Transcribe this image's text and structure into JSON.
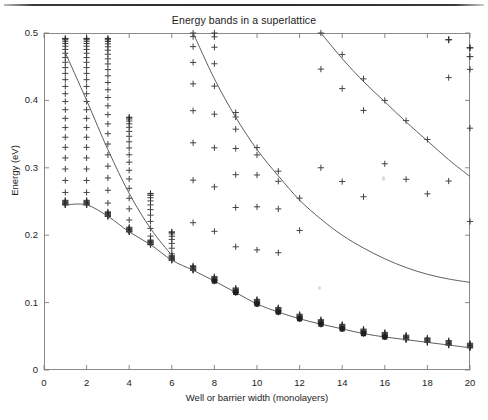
{
  "figure": {
    "title": "Energy bands in a superlattice",
    "page_rule": "horizontal-rule"
  },
  "chart_data": {
    "type": "scatter",
    "title": "Energy bands in a superlattice",
    "xlabel": "Well or barrier width (monolayers)",
    "ylabel": "Energy (eV)",
    "xlim": [
      0,
      20
    ],
    "ylim": [
      0,
      0.5
    ],
    "xticks": [
      0,
      2,
      4,
      6,
      8,
      10,
      12,
      14,
      16,
      18,
      20
    ],
    "xtick_labels": [
      "0",
      "2",
      "4",
      "6",
      "8",
      "10",
      "12",
      "14",
      "16",
      "18",
      "20"
    ],
    "yticks": [
      0,
      0.1,
      0.2,
      0.3,
      0.4,
      0.5
    ],
    "ytick_labels": [
      "0",
      "0.1",
      "0.2",
      "0.3",
      "0.4",
      "0.5"
    ],
    "grid": false,
    "legend": false,
    "marker": "plus",
    "marker_color": "#2b2b2b",
    "line_color": "#555555",
    "band_edges_note": "Vertical columns of + markers mark the allowed miniband extent at each integer monolayer width; solid curves trace the band-edge energies.",
    "series": [
      {
        "name": "band-1-edge",
        "x": [
          1,
          2,
          3,
          4,
          5,
          6,
          7,
          8,
          9,
          10,
          11,
          12,
          13,
          14,
          15,
          16,
          17,
          18,
          19,
          20
        ],
        "values": [
          0.245,
          0.245,
          0.228,
          0.205,
          0.186,
          0.163,
          0.148,
          0.132,
          0.115,
          0.098,
          0.086,
          0.076,
          0.068,
          0.061,
          0.054,
          0.049,
          0.045,
          0.041,
          0.037,
          0.033
        ]
      },
      {
        "name": "band-2-edge",
        "x": [
          7,
          8,
          9,
          10,
          11,
          12,
          13,
          14,
          15,
          16,
          17,
          18,
          19,
          20
        ],
        "values": [
          0.5,
          0.432,
          0.375,
          0.327,
          0.288,
          0.252,
          0.224,
          0.2,
          0.181,
          0.165,
          0.152,
          0.142,
          0.135,
          0.13
        ]
      },
      {
        "name": "band-3-edge",
        "x": [
          13,
          14,
          15,
          16,
          17,
          18,
          19,
          20
        ],
        "values": [
          0.5,
          0.462,
          0.428,
          0.398,
          0.368,
          0.34,
          0.312,
          0.287
        ]
      },
      {
        "name": "band-0-line",
        "x": [
          1,
          2,
          3,
          4,
          5,
          6
        ],
        "values": [
          0.471,
          0.4,
          0.327,
          0.262,
          0.21,
          0.17
        ]
      }
    ],
    "columns": [
      {
        "x": 1,
        "top": 0.492,
        "bottom": 0.245,
        "count": 26
      },
      {
        "x": 2,
        "top": 0.492,
        "bottom": 0.245,
        "count": 26
      },
      {
        "x": 3,
        "top": 0.492,
        "bottom": 0.228,
        "count": 26
      },
      {
        "x": 4,
        "top": 0.375,
        "bottom": 0.205,
        "count": 19
      },
      {
        "x": 5,
        "top": 0.262,
        "bottom": 0.186,
        "count": 12
      },
      {
        "x": 6,
        "top": 0.205,
        "bottom": 0.163,
        "count": 9
      },
      {
        "x": 7,
        "top": 0.5,
        "bottom": 0.148,
        "count": 10
      },
      {
        "x": 8,
        "top": 0.5,
        "bottom": 0.132,
        "count": 10
      },
      {
        "x": 9,
        "top": 0.382,
        "bottom": 0.115,
        "count": 8
      },
      {
        "x": 10,
        "top": 0.33,
        "bottom": 0.098,
        "count": 6
      },
      {
        "x": 11,
        "top": 0.295,
        "bottom": 0.086,
        "count": 5
      },
      {
        "x": 12,
        "top": 0.255,
        "bottom": 0.076,
        "count": 3
      },
      {
        "x": 13,
        "top": 0.5,
        "bottom": 0.068,
        "count": 4
      },
      {
        "x": 14,
        "top": 0.468,
        "bottom": 0.061,
        "count": 4
      },
      {
        "x": 15,
        "top": 0.432,
        "bottom": 0.054,
        "count": 4
      },
      {
        "x": 16,
        "top": 0.4,
        "bottom": 0.049,
        "count": 3
      },
      {
        "x": 17,
        "top": 0.37,
        "bottom": 0.045,
        "count": 3
      },
      {
        "x": 18,
        "top": 0.342,
        "bottom": 0.041,
        "count": 3
      },
      {
        "x": 19,
        "top": 0.49,
        "bottom": 0.037,
        "count": 4
      },
      {
        "x": 20,
        "top": 0.478,
        "bottom": 0.033,
        "count": 5
      }
    ],
    "extra_markers": [
      {
        "x": 19,
        "y": 0.49
      },
      {
        "x": 20,
        "y": 0.478
      },
      {
        "x": 20,
        "y": 0.465
      }
    ]
  }
}
